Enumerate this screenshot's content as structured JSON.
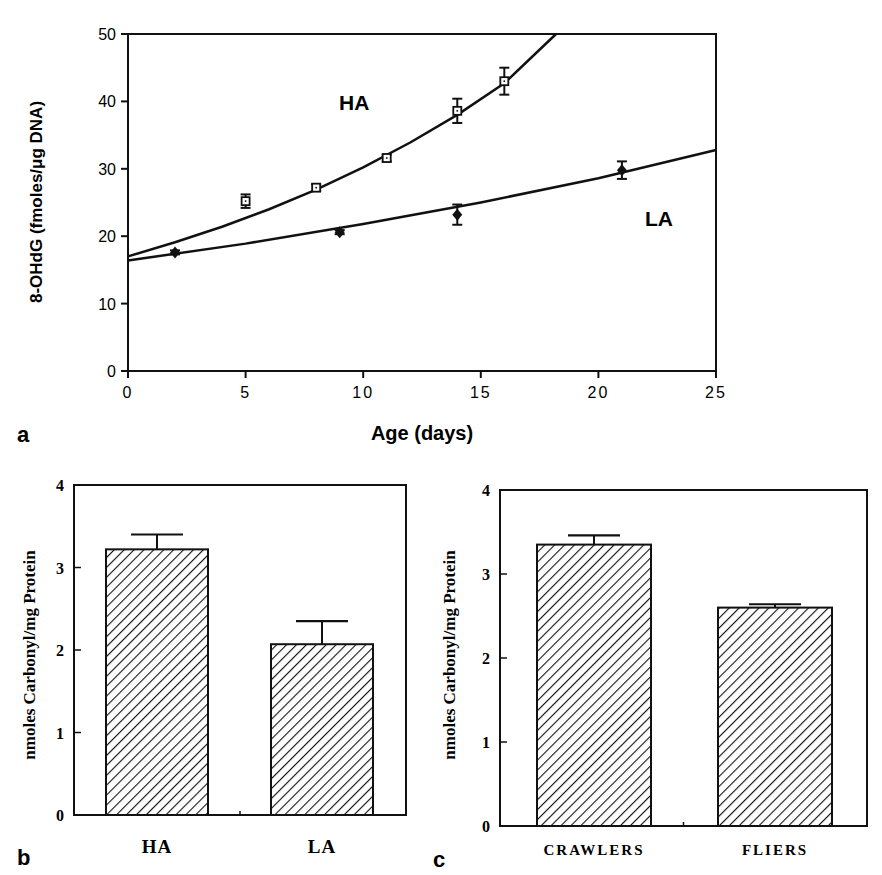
{
  "panels": {
    "a": {
      "letter": "a"
    },
    "b": {
      "letter": "b"
    },
    "c": {
      "letter": "c"
    }
  },
  "chart_data": [
    {
      "id": "a",
      "type": "scatter",
      "title": "",
      "xlabel": "Age (days)",
      "ylabel": "8-OHdG (fmoles/μg DNA)",
      "xlim": [
        0,
        25
      ],
      "ylim": [
        0,
        50
      ],
      "xticks": [
        0,
        5,
        10,
        15,
        20,
        25
      ],
      "yticks": [
        0,
        10,
        20,
        30,
        40,
        50
      ],
      "grid": false,
      "legend": "inline labels",
      "series": [
        {
          "name": "HA",
          "marker": "open-square",
          "x": [
            5,
            8,
            11,
            14,
            16
          ],
          "y": [
            25.2,
            27.2,
            31.6,
            38.6,
            43.0
          ],
          "err": [
            1.0,
            0.5,
            0.5,
            1.8,
            2.0
          ],
          "fit": {
            "type": "exponential",
            "x": [
              0,
              2,
              4,
              6,
              8,
              10,
              12,
              14,
              16,
              18.2
            ],
            "y": [
              17.0,
              19.1,
              21.4,
              24.0,
              26.9,
              30.2,
              33.9,
              38.0,
              42.7,
              50.0
            ]
          }
        },
        {
          "name": "LA",
          "marker": "filled-diamond",
          "x": [
            2,
            9,
            14,
            21
          ],
          "y": [
            17.6,
            20.6,
            23.2,
            29.8
          ],
          "err": [
            0.3,
            0.3,
            1.5,
            1.3
          ],
          "fit": {
            "type": "exponential",
            "x": [
              0,
              5,
              10,
              15,
              20,
              25
            ],
            "y": [
              16.4,
              18.9,
              21.8,
              25.0,
              28.6,
              32.8
            ]
          }
        }
      ],
      "annotations": [
        "HA",
        "LA"
      ]
    },
    {
      "id": "b",
      "type": "bar",
      "title": "",
      "xlabel": "",
      "ylabel": "nmoles Carbonyl/mg Protein",
      "categories": [
        "HA",
        "LA"
      ],
      "values": [
        3.22,
        2.07
      ],
      "error_upper": [
        3.4,
        2.35
      ],
      "ylim": [
        0,
        4
      ],
      "yticks": [
        0,
        1,
        2,
        3,
        4
      ],
      "grid": false,
      "fill": "diagonal-hatch"
    },
    {
      "id": "c",
      "type": "bar",
      "title": "",
      "xlabel": "",
      "ylabel": "nmoles Carbonyl/mg Protein",
      "categories": [
        "CRAWLERS",
        "FLIERS"
      ],
      "values": [
        3.35,
        2.6
      ],
      "error_upper": [
        3.46,
        2.64
      ],
      "ylim": [
        0,
        4
      ],
      "yticks": [
        0,
        1,
        2,
        3,
        4
      ],
      "grid": false,
      "fill": "diagonal-hatch"
    }
  ],
  "colors": {
    "ink": "#111111",
    "background": "#ffffff"
  }
}
